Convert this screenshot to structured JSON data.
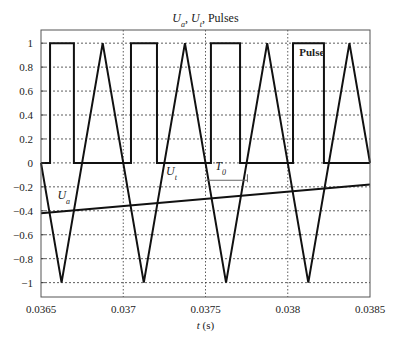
{
  "chart_data": {
    "type": "line",
    "title": {
      "parts": [
        {
          "text": "U",
          "italic": true
        },
        {
          "text": "a",
          "italic": true,
          "sub": true
        },
        {
          "text": ", ",
          "italic": false
        },
        {
          "text": "U",
          "italic": true
        },
        {
          "text": "t",
          "italic": true,
          "sub": true
        },
        {
          "text": ", Pulses",
          "italic": false
        }
      ]
    },
    "xlabel": {
      "var": "t",
      "unit": " (s)"
    },
    "ylabel": "",
    "xlim": [
      0.0365,
      0.0385
    ],
    "ylim": [
      -1.12,
      1.11
    ],
    "grid": true,
    "xticks": [
      0.0365,
      0.037,
      0.0375,
      0.038,
      0.0385
    ],
    "xtick_labels": [
      "0.0365",
      "0.037",
      "0.0375",
      "0.038",
      "0.0385"
    ],
    "yticks": [
      1,
      0.8,
      0.6,
      0.4,
      0.2,
      0,
      -0.2,
      -0.4,
      -0.6,
      -0.8,
      -1
    ],
    "ytick_labels": [
      "1",
      "0.8",
      "0.6",
      "0.4",
      "0.2",
      "0",
      "−0.2",
      "−0.4",
      "−0.6",
      "−0.8",
      "−1"
    ],
    "series": [
      {
        "name": "Ut",
        "kind": "triangle",
        "period": 0.0005,
        "amplitude": 1,
        "phase_start_value": 0,
        "initial_direction": "down",
        "points": [
          [
            0.0365,
            0
          ],
          [
            0.036625,
            -1
          ],
          [
            0.036875,
            1
          ],
          [
            0.037125,
            -1
          ],
          [
            0.037375,
            1
          ],
          [
            0.037625,
            -1
          ],
          [
            0.037875,
            1
          ],
          [
            0.038125,
            -1
          ],
          [
            0.038375,
            1
          ],
          [
            0.0385,
            0
          ]
        ]
      },
      {
        "name": "Ua",
        "kind": "linear",
        "points": [
          [
            0.0365,
            -0.42
          ],
          [
            0.0385,
            -0.18
          ]
        ]
      },
      {
        "name": "Pulses",
        "kind": "step",
        "low": 0,
        "high": 1,
        "high_intervals": [
          [
            0.036555,
            0.0367
          ],
          [
            0.037047,
            0.037205
          ],
          [
            0.037533,
            0.03771
          ],
          [
            0.038032,
            0.03822
          ]
        ]
      }
    ],
    "annotations": [
      {
        "id": "label-ua",
        "text": "U",
        "sub": "a",
        "x": 0.0366,
        "y": -0.3
      },
      {
        "id": "label-ut",
        "text": "U",
        "sub": "t",
        "x": 0.03726,
        "y": -0.1
      },
      {
        "id": "label-t0",
        "text": "T",
        "sub": "0",
        "x": 0.03756,
        "y": -0.06
      },
      {
        "id": "label-pulse",
        "text": "Pulse",
        "x": 0.03807,
        "y": 0.89
      }
    ],
    "t0_bracket": [
      0.0375,
      0.037755,
      -0.145
    ]
  }
}
